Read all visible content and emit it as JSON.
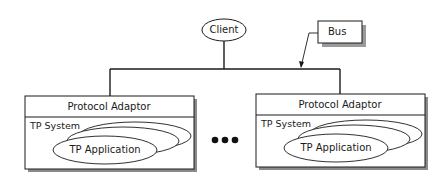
{
  "diagram": {
    "client": {
      "label": "Client"
    },
    "bus": {
      "label": "Bus"
    },
    "nodes": [
      {
        "adaptor_label": "Protocol Adaptor",
        "system_label": "TP System",
        "application_label": "TP Application"
      },
      {
        "adaptor_label": "Protocol Adaptor",
        "system_label": "TP System",
        "application_label": "TP Application"
      }
    ],
    "ellipsis": "•••",
    "colors": {
      "line": "#1a1a1a",
      "shadow": "#8a8a8a",
      "fill": "#ffffff"
    }
  }
}
